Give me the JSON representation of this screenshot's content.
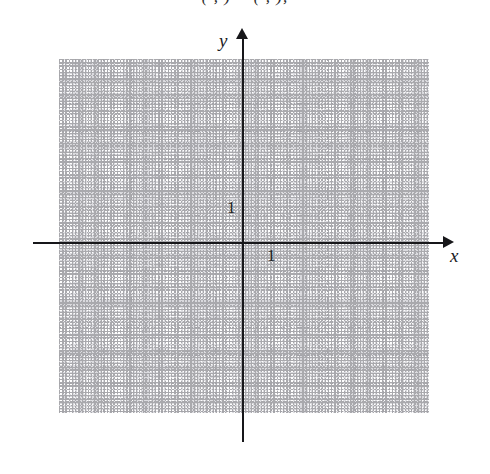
{
  "figure": {
    "type": "coordinate-grid",
    "title_fragment": "( , ) = ( , ),",
    "background_color": "#ffffff",
    "axis_color": "#17171a",
    "major_grid_color": "#a3a3a8",
    "minor_grid_color": "#dcdce0"
  },
  "axes": {
    "x": {
      "name": "x",
      "unit_label": "1",
      "arrow": "right-arrow-icon"
    },
    "y": {
      "name": "y",
      "unit_label": "1",
      "arrow": "up-arrow-icon"
    }
  },
  "chart_data": {
    "type": "scatter",
    "title": "",
    "subtitle": "( , ) = ( , ),",
    "xlabel": "x",
    "ylabel": "y",
    "series": [
      {
        "name": "",
        "x": [],
        "y": []
      }
    ],
    "x_tick_labels": [
      "1"
    ],
    "y_tick_labels": [
      "1"
    ],
    "xlim": [
      -6.5,
      6.6
    ],
    "ylim": [
      -6.1,
      6.6
    ],
    "major_grid_step": 1,
    "minor_grid_step": 0.2,
    "grid": true,
    "legend": "none",
    "annotations": [],
    "note": "Empty Cartesian graph paper; no data points plotted."
  }
}
